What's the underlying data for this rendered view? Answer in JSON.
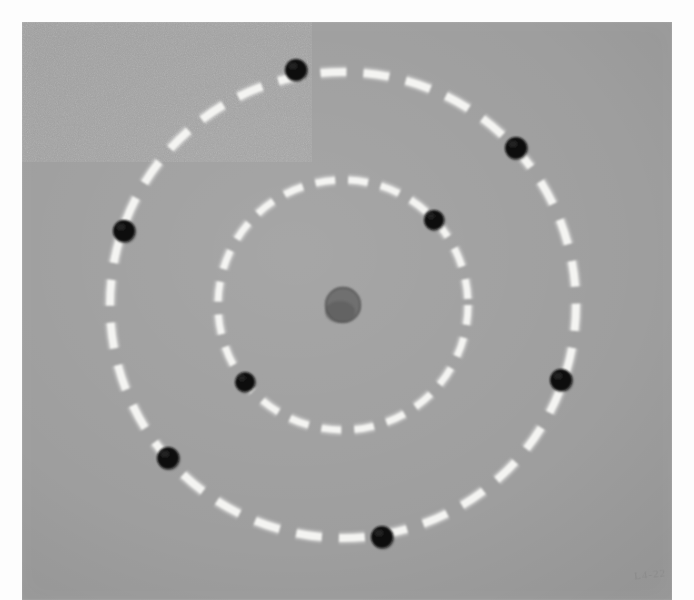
{
  "figure": {
    "caption": "",
    "medium": "black-and-white photographic print",
    "annotation_text": "L4-22"
  },
  "colors": {
    "paper": "#fdfdfd",
    "print_background": "#9e9e9e",
    "orbit_stroke": "#f4f4f2",
    "electron_fill": "#111111",
    "nucleus_fill": "#6f6f6f"
  },
  "photo": {
    "left": 22,
    "top": 22,
    "width": 650,
    "height": 578
  },
  "chart_data": {
    "type": "scatter",
    "subtitle": "",
    "xlabel": "",
    "ylabel": "",
    "xlim": [
      22,
      672
    ],
    "ylim": [
      22,
      600
    ],
    "grid": false,
    "legend_position": "none",
    "axis_ticks": [],
    "tick_labels": [],
    "center": {
      "x": 343,
      "y": 305
    },
    "nucleus": {
      "label": "nucleus",
      "x": 343,
      "y": 305,
      "radius": 18,
      "color": "#6f6f6f"
    },
    "orbits": [
      {
        "name": "inner-orbit",
        "shape": "circle",
        "cx": 343,
        "cy": 305,
        "radius": 125,
        "stroke_width": 7,
        "dash": "20 13",
        "color": "#f4f4f2",
        "electron_count": 2
      },
      {
        "name": "outer-orbit",
        "shape": "circle",
        "cx": 343,
        "cy": 305,
        "radius": 233,
        "stroke_width": 8,
        "dash": "26 17",
        "color": "#f4f4f2",
        "electron_count": 6
      }
    ],
    "series": [
      {
        "name": "inner-shell-electrons",
        "orbit": "inner-orbit",
        "marker": "filled-circle",
        "color": "#111111",
        "radius": 10,
        "values": [
          {
            "label": "electron-1",
            "x": 434,
            "y": 220,
            "angle_deg": 320
          },
          {
            "label": "electron-2",
            "x": 245,
            "y": 382,
            "angle_deg": 140
          }
        ]
      },
      {
        "name": "outer-shell-electrons",
        "orbit": "outer-orbit",
        "marker": "filled-circle",
        "color": "#111111",
        "radius": 11,
        "values": [
          {
            "label": "electron-3",
            "x": 296,
            "y": 70,
            "angle_deg": 101
          },
          {
            "label": "electron-4",
            "x": 516,
            "y": 148,
            "angle_deg": 37
          },
          {
            "label": "electron-5",
            "x": 561,
            "y": 380,
            "angle_deg": 341
          },
          {
            "label": "electron-6",
            "x": 382,
            "y": 537,
            "angle_deg": 279
          },
          {
            "label": "electron-7",
            "x": 168,
            "y": 458,
            "angle_deg": 220
          },
          {
            "label": "electron-8",
            "x": 124,
            "y": 231,
            "angle_deg": 162
          }
        ]
      }
    ]
  }
}
